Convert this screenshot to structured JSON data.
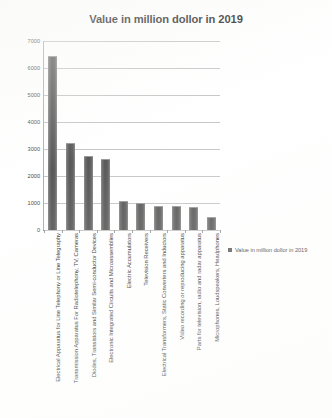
{
  "chart_data": {
    "type": "bar",
    "title": "Value in million dollor in 2019",
    "xlabel": "",
    "ylabel": "",
    "ylim": [
      0,
      7000
    ],
    "yticks": [
      0,
      1000,
      2000,
      3000,
      4000,
      5000,
      6000,
      7000
    ],
    "ytick_labels": [
      "0",
      "1000",
      "2000",
      "3000",
      "4000",
      "5000",
      "6000",
      "7000"
    ],
    "grid": true,
    "legend_position": "right",
    "legend": [
      "Value in million dollor in 2019"
    ],
    "bar_color": "#5e5e5e",
    "categories": [
      "Electrical Apparatus for Line Telephony or Line Telegraphy",
      "Transmission Apparatus For Radiotelephony, TV, Cameras",
      "Diodes, Transistors and Similar Semi-conductor  Devices",
      "Electronic Integrated Circuits and Microassemblies",
      "Electric Accumulators",
      "Television Receivers",
      "Electrical Transformers, Static Converters and Inductors",
      "Video recording  or reproducing  apparatus",
      "Parts for television, radio and radar apparatus",
      "Microphones, Loudspeakers, Headphones"
    ],
    "values": [
      6400,
      3180,
      2700,
      2600,
      1050,
      950,
      870,
      840,
      830,
      450
    ]
  }
}
